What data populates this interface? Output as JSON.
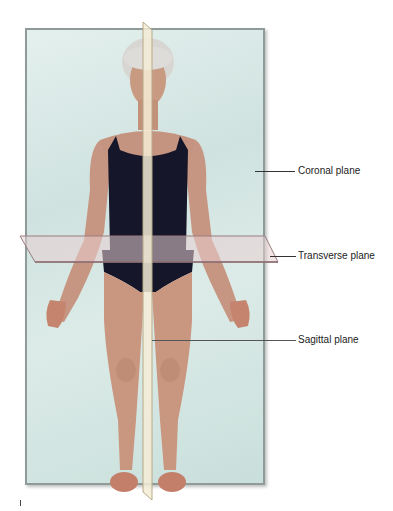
{
  "figure": {
    "labels": {
      "coronal": "Coronal plane",
      "transverse": "Transverse plane",
      "sagittal": "Sagittal plane"
    },
    "colors": {
      "coronal_plane": "#d4e6e3",
      "transverse_plane": "#e8cfd2",
      "sagittal_plane": "#f4ecd6",
      "swimsuit": "#15162a",
      "skin": "#c99a84",
      "hair": "#d8d6d2"
    }
  }
}
